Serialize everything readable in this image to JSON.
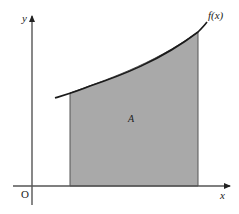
{
  "diagram": {
    "labels": {
      "y_axis": "y",
      "x_axis": "x",
      "origin": "O",
      "curve": "f(x)",
      "region": "A"
    },
    "colors": {
      "region_fill": "#a9a9a9",
      "curve": "#1a1a1a",
      "axes": "#555555",
      "region_border": "#555555"
    }
  }
}
